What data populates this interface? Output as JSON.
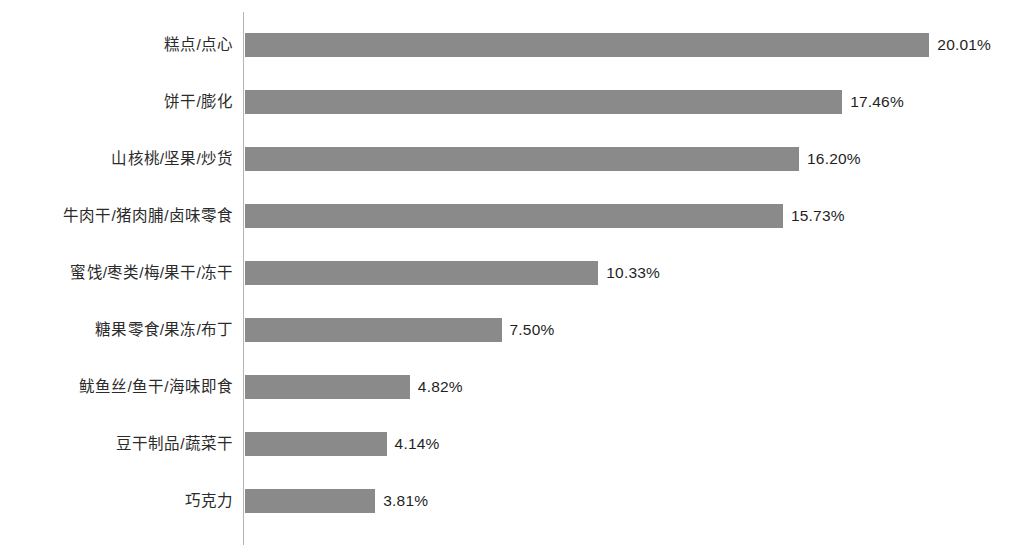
{
  "chart_data": {
    "type": "bar",
    "orientation": "horizontal",
    "title": "",
    "subtitle": "",
    "xlabel": "",
    "ylabel": "",
    "grid": false,
    "legend": null,
    "axis_line": true,
    "value_label_suffix": "%",
    "xlim": [
      0,
      20.01
    ],
    "categories": [
      "糕点/点心",
      "饼干/膨化",
      "山核桃/坚果/炒货",
      "牛肉干/猪肉脯/卤味零食",
      "蜜饯/枣类/梅/果干/冻干",
      "糖果零食/果冻/布丁",
      "鱿鱼丝/鱼干/海味即食",
      "豆干制品/蔬菜干",
      "巧克力"
    ],
    "values": [
      20.01,
      17.46,
      16.2,
      15.73,
      10.33,
      7.5,
      4.82,
      4.14,
      3.81
    ],
    "value_labels": [
      "20.01%",
      "17.46%",
      "16.20%",
      "15.73%",
      "10.33%",
      "7.50%",
      "4.82%",
      "4.14%",
      "3.81%"
    ],
    "colors": {
      "bar": "#8a8a8a",
      "axis": "#b4b4b4",
      "background": "#ffffff",
      "category_text": "#2b2b2b",
      "value_text": "#1f1f1f"
    }
  },
  "layout": {
    "plot_left_px": 245,
    "px_per_percent": 34.2,
    "row_pitch_px": 57,
    "first_row_top_px": 33,
    "bar_height_px": 24,
    "value_gap_px": 8
  }
}
